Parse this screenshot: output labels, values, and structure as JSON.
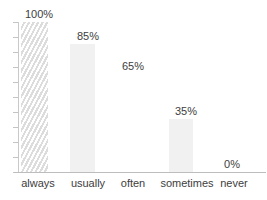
{
  "chart_data": {
    "type": "bar",
    "title": "",
    "subtitle": "",
    "xlabel": "",
    "ylabel": "",
    "categories": [
      "always",
      "usually",
      "often",
      "sometimes",
      "never"
    ],
    "values": [
      100,
      85,
      65,
      35,
      0
    ],
    "value_labels": [
      "100%",
      "85%",
      "65%",
      "35%",
      "0%"
    ],
    "ylim": [
      0,
      100
    ],
    "grid": false,
    "legend": null,
    "legend_position": "none",
    "y_axis_tick_count": 11,
    "y_axis_tick_labels": [],
    "series": [
      {
        "name": "",
        "values": [
          100,
          85,
          65,
          35,
          0
        ]
      }
    ],
    "bar_styles": [
      "hatched",
      "solid",
      "invisible",
      "solid",
      "none"
    ],
    "colors": {
      "bar_fill": "#f1f1f1",
      "hatch_line": "#dcdcdc",
      "axis": "#c4c4c4",
      "baseline": "#bdbdbd",
      "text": "#3d3d3d",
      "background": "#ffffff"
    }
  }
}
